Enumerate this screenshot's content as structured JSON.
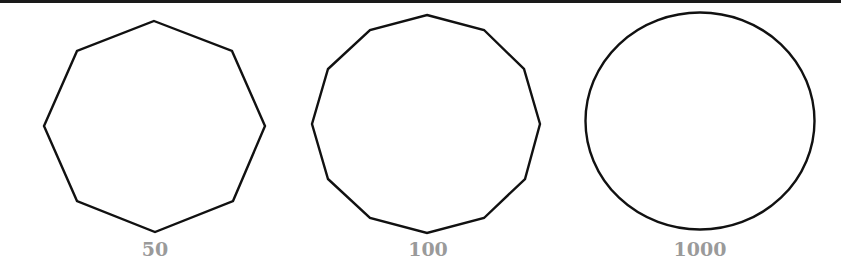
{
  "figure": {
    "stroke_color": "#111111",
    "label_color": "#9a9a9a",
    "panels": [
      {
        "label": "50",
        "shape": "octagon",
        "points": "154,21 232,51 265,126 233,201 155,232 77,201 44,126 77,51"
      },
      {
        "label": "100",
        "shape": "dodecagon",
        "points": "427,15 484,30 524,69 540,124 525,179 484,218 427,233 370,218 328,179 312,124 328,69 370,30"
      },
      {
        "label": "1000",
        "shape": "circle",
        "cx": 700,
        "cy": 121,
        "rx": 114.5,
        "ry": 108.5
      }
    ]
  }
}
